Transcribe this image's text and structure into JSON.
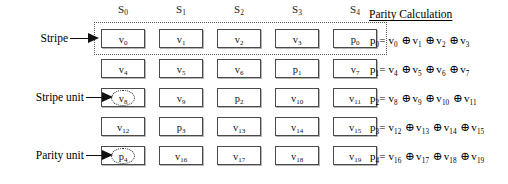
{
  "figure": {
    "type": "raid-stripe-layout-diagram",
    "columns": [
      {
        "id": "S0",
        "label": "S",
        "subscript": "0"
      },
      {
        "id": "S1",
        "label": "S",
        "subscript": "1"
      },
      {
        "id": "S2",
        "label": "S",
        "subscript": "2"
      },
      {
        "id": "S3",
        "label": "S",
        "subscript": "3"
      },
      {
        "id": "S4",
        "label": "S",
        "subscript": "4"
      }
    ],
    "grid": {
      "rows": 5,
      "cols": 5,
      "cells": [
        [
          {
            "base": "v",
            "sub": "0",
            "kind": "data",
            "highlight": false
          },
          {
            "base": "v",
            "sub": "1",
            "kind": "data",
            "highlight": false
          },
          {
            "base": "v",
            "sub": "2",
            "kind": "data",
            "highlight": false
          },
          {
            "base": "v",
            "sub": "3",
            "kind": "data",
            "highlight": false
          },
          {
            "base": "p",
            "sub": "0",
            "kind": "parity",
            "highlight": false
          }
        ],
        [
          {
            "base": "v",
            "sub": "4",
            "kind": "data",
            "highlight": false
          },
          {
            "base": "v",
            "sub": "5",
            "kind": "data",
            "highlight": false
          },
          {
            "base": "v",
            "sub": "6",
            "kind": "data",
            "highlight": false
          },
          {
            "base": "p",
            "sub": "1",
            "kind": "parity",
            "highlight": false
          },
          {
            "base": "v",
            "sub": "7",
            "kind": "data",
            "highlight": false
          }
        ],
        [
          {
            "base": "v",
            "sub": "8",
            "kind": "data",
            "highlight": true
          },
          {
            "base": "v",
            "sub": "9",
            "kind": "data",
            "highlight": false
          },
          {
            "base": "p",
            "sub": "2",
            "kind": "parity",
            "highlight": false
          },
          {
            "base": "v",
            "sub": "10",
            "kind": "data",
            "highlight": false
          },
          {
            "base": "v",
            "sub": "11",
            "kind": "data",
            "highlight": false
          }
        ],
        [
          {
            "base": "v",
            "sub": "12",
            "kind": "data",
            "highlight": false
          },
          {
            "base": "p",
            "sub": "3",
            "kind": "parity",
            "highlight": false
          },
          {
            "base": "v",
            "sub": "13",
            "kind": "data",
            "highlight": false
          },
          {
            "base": "v",
            "sub": "14",
            "kind": "data",
            "highlight": false
          },
          {
            "base": "v",
            "sub": "15",
            "kind": "data",
            "highlight": false
          }
        ],
        [
          {
            "base": "p",
            "sub": "4",
            "kind": "parity",
            "highlight": true
          },
          {
            "base": "v",
            "sub": "16",
            "kind": "data",
            "highlight": false
          },
          {
            "base": "v",
            "sub": "17",
            "kind": "data",
            "highlight": false
          },
          {
            "base": "v",
            "sub": "18",
            "kind": "data",
            "highlight": false
          },
          {
            "base": "v",
            "sub": "19",
            "kind": "data",
            "highlight": false
          }
        ]
      ]
    },
    "callouts": [
      {
        "id": "stripe",
        "label": "Stripe",
        "target_row": 0,
        "target_col": 0
      },
      {
        "id": "stripe-unit",
        "label": "Stripe unit",
        "target_row": 2,
        "target_col": 0
      },
      {
        "id": "parity-unit",
        "label": "Parity unit",
        "target_row": 4,
        "target_col": 0
      }
    ],
    "stripe_outline": {
      "row": 0,
      "style": "dotted",
      "note": "dotted rectangle enclosing the entire first row"
    },
    "parity_panel": {
      "title": "Parity Calculation",
      "operator": "⊕",
      "equations": [
        {
          "lhs_base": "p",
          "lhs_sub": "0",
          "terms": [
            {
              "base": "v",
              "sub": "0"
            },
            {
              "base": "v",
              "sub": "1"
            },
            {
              "base": "v",
              "sub": "2"
            },
            {
              "base": "v",
              "sub": "3"
            }
          ]
        },
        {
          "lhs_base": "p",
          "lhs_sub": "1",
          "terms": [
            {
              "base": "v",
              "sub": "4"
            },
            {
              "base": "v",
              "sub": "5"
            },
            {
              "base": "v",
              "sub": "6"
            },
            {
              "base": "v",
              "sub": "7"
            }
          ]
        },
        {
          "lhs_base": "p",
          "lhs_sub": "2",
          "terms": [
            {
              "base": "v",
              "sub": "8"
            },
            {
              "base": "v",
              "sub": "9"
            },
            {
              "base": "v",
              "sub": "10"
            },
            {
              "base": "v",
              "sub": "11"
            }
          ]
        },
        {
          "lhs_base": "p",
          "lhs_sub": "3",
          "terms": [
            {
              "base": "v",
              "sub": "12"
            },
            {
              "base": "v",
              "sub": "13"
            },
            {
              "base": "v",
              "sub": "14"
            },
            {
              "base": "v",
              "sub": "15"
            }
          ]
        },
        {
          "lhs_base": "p",
          "lhs_sub": "4",
          "terms": [
            {
              "base": "v",
              "sub": "16"
            },
            {
              "base": "v",
              "sub": "17"
            },
            {
              "base": "v",
              "sub": "18"
            },
            {
              "base": "v",
              "sub": "19"
            }
          ]
        }
      ]
    },
    "colors": {
      "background": "#ffffff",
      "text": "#000000",
      "cell_border": "#4a4a4a",
      "dotted_border": "#5a5a5a",
      "arrow": "#111111"
    }
  }
}
